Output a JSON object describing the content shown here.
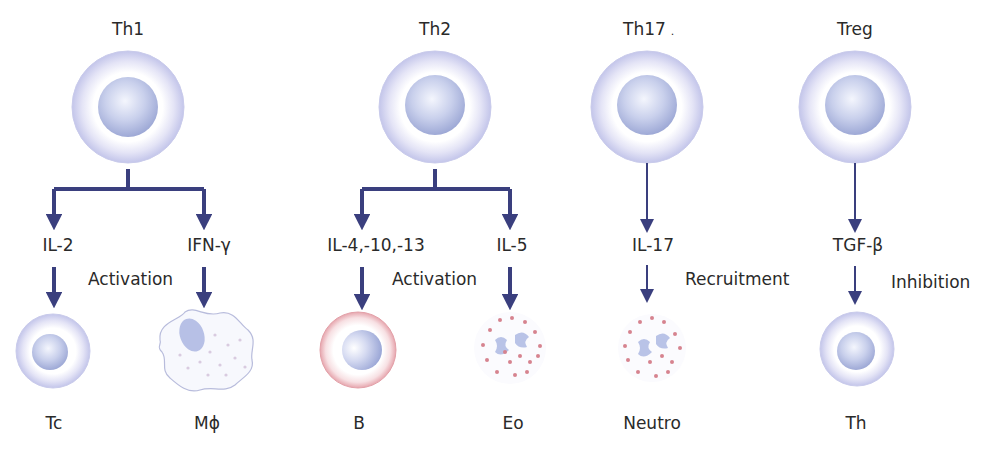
{
  "diagram": {
    "colors": {
      "arrow": "#3a3f7e",
      "cell_membrane": "#c8c9ec",
      "nucleus": "#a9b3dc",
      "b_cell_membrane": "#e8a6ad",
      "granule": "#d6838f"
    },
    "columns": [
      {
        "id": "th1",
        "source": "Th1",
        "branches": [
          {
            "cytokine": "IL-2",
            "target": "Tc"
          },
          {
            "cytokine": "IFN-γ",
            "target": "Mϕ"
          }
        ],
        "effect": "Activation"
      },
      {
        "id": "th2",
        "source": "Th2",
        "branches": [
          {
            "cytokine": "IL-4,-10,-13",
            "target": "B"
          },
          {
            "cytokine": "IL-5",
            "target": "Eo"
          }
        ],
        "effect": "Activation"
      },
      {
        "id": "th17",
        "source": "Th17",
        "source_mark": ".",
        "branches": [
          {
            "cytokine": "IL-17",
            "target": "Neutro"
          }
        ],
        "effect": "Recruitment"
      },
      {
        "id": "treg",
        "source": "Treg",
        "branches": [
          {
            "cytokine": "TGF-β",
            "target": "Th"
          }
        ],
        "effect": "Inhibition"
      }
    ]
  }
}
